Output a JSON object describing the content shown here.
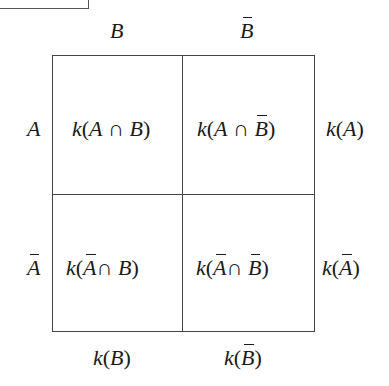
{
  "diagram": {
    "type": "contingency-table",
    "column_headers": [
      {
        "symbol": "B",
        "complement": false
      },
      {
        "symbol": "B",
        "complement": true
      }
    ],
    "row_headers": [
      {
        "symbol": "A",
        "complement": false
      },
      {
        "symbol": "A",
        "complement": true
      }
    ],
    "cells": [
      [
        "k(A ∩ B)",
        "k(A ∩ B̄)"
      ],
      [
        "k(Ā ∩ B)",
        "k(Ā ∩ B̄)"
      ]
    ],
    "row_totals": [
      "k(A)",
      "k(Ā)"
    ],
    "column_totals": [
      "k(B)",
      "k(B̄)"
    ],
    "glyphs": {
      "k": "k",
      "open": "(",
      "close": ")",
      "cap": "∩",
      "A": "A",
      "B": "B"
    }
  }
}
